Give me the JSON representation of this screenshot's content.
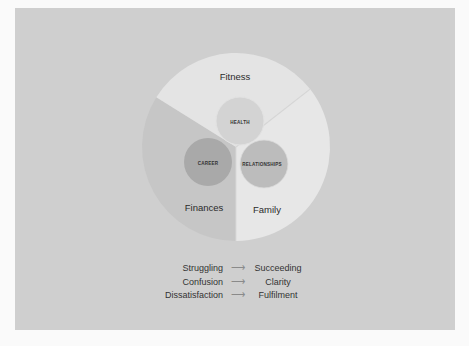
{
  "colors": {
    "page_bg": "#fafafa",
    "card_bg": "#cfcfcf",
    "segment_fitness": "#e4e4e4",
    "segment_finances": "#c6c6c6",
    "segment_family": "#e7e7e7",
    "circle_health": "#d3d3d3",
    "circle_career": "#a9a9a9",
    "circle_relationships": "#bcbcbc",
    "text": "#2b2b2b"
  },
  "diagram": {
    "outer_segments": [
      {
        "id": "fitness",
        "label": "Fitness"
      },
      {
        "id": "finances",
        "label": "Finances"
      },
      {
        "id": "family",
        "label": "Family"
      }
    ],
    "inner_circles": [
      {
        "id": "health",
        "label": "HEALTH"
      },
      {
        "id": "career",
        "label": "CAREER"
      },
      {
        "id": "relationships",
        "label": "RELATIONSHIPS"
      }
    ]
  },
  "transitions": [
    {
      "from": "Struggling",
      "arrow": "⟶",
      "to": "Succeeding"
    },
    {
      "from": "Confusion",
      "arrow": "⟶",
      "to": "Clarity"
    },
    {
      "from": "Dissatisfaction",
      "arrow": "⟶",
      "to": "Fulfilment"
    }
  ]
}
